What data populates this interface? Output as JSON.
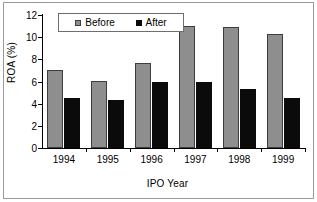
{
  "chart_data": {
    "type": "bar",
    "title": "",
    "xlabel": "IPO Year",
    "ylabel": "ROA (%)",
    "categories": [
      "1994",
      "1995",
      "1996",
      "1997",
      "1998",
      "1999"
    ],
    "series": [
      {
        "name": "Before",
        "color": "#8e8e8e",
        "values": [
          7.0,
          6.05,
          7.7,
          11.05,
          10.95,
          10.3
        ]
      },
      {
        "name": "After",
        "color": "#0b0b0b",
        "values": [
          4.55,
          4.3,
          6.0,
          6.0,
          5.3,
          4.5
        ]
      }
    ],
    "ylim": [
      0,
      12
    ],
    "yticks": [
      0,
      2,
      4,
      6,
      8,
      10,
      12
    ],
    "ytick_labels": [
      "0",
      "2",
      "4",
      "6",
      "8",
      "10",
      "12"
    ],
    "grid": false,
    "legend_position": "top-left-inside",
    "legend_entries": [
      "Before",
      "After"
    ]
  }
}
